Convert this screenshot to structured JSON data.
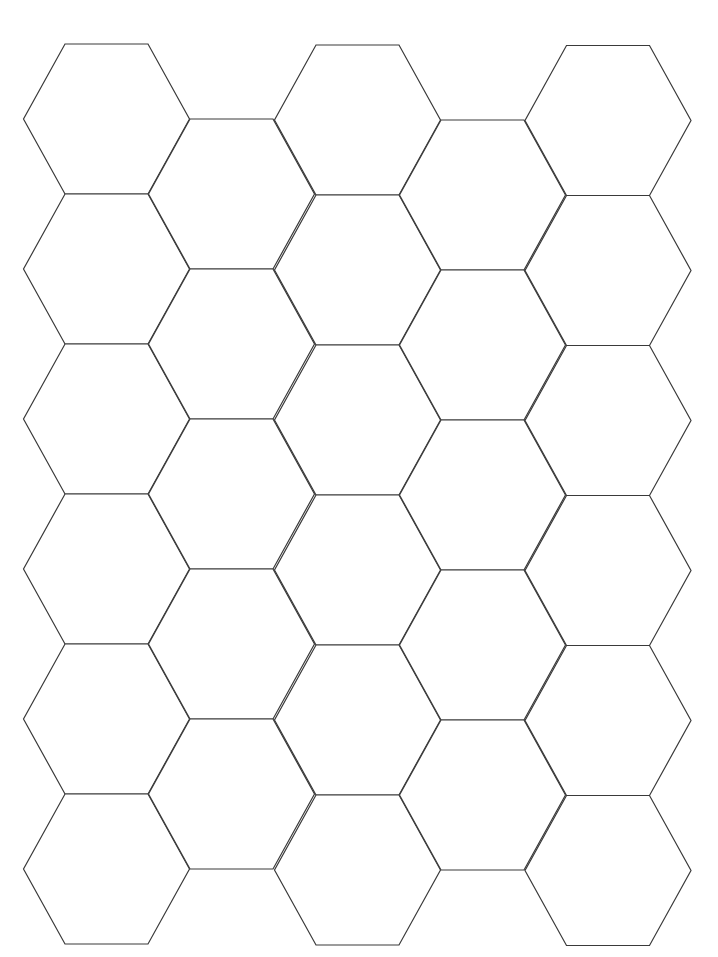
{
  "page": {
    "background": "#ffffff",
    "width": 718,
    "height": 957
  },
  "hex_grid": {
    "orientation": "flat-top",
    "line_color": "#3a3a3a",
    "fill_color": "#ffffff",
    "hex_half_width": 83,
    "hex_edge_half_width": 41.5,
    "hex_half_height": 75,
    "row_step": 150,
    "columns": [
      {
        "cx": 106.5,
        "first_cy": 119,
        "count": 6
      },
      {
        "cx": 231.5,
        "first_cy": 194,
        "count": 5
      },
      {
        "cx": 357.5,
        "first_cy": 120,
        "count": 6
      },
      {
        "cx": 482.5,
        "first_cy": 195,
        "count": 5
      },
      {
        "cx": 608,
        "first_cy": 120.5,
        "count": 6
      }
    ],
    "total_hexagons": 28
  }
}
